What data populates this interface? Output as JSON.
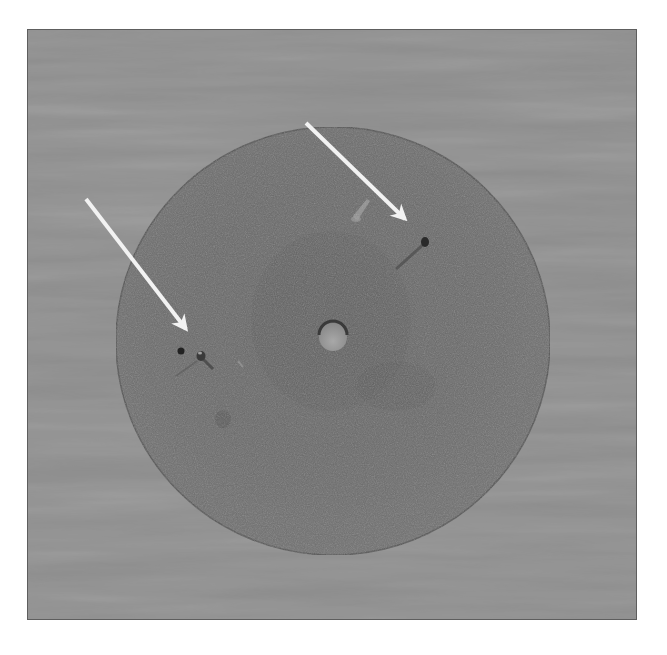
{
  "image": {
    "description": "Grayscale photograph of a flat circular disc with a small central hole resting on a fabric background; two white arrows point to surface defects",
    "frame": {
      "x": 27,
      "y": 29,
      "width": 610,
      "height": 591,
      "border_color": "#5e5e5e"
    },
    "colors": {
      "page_background": "#ffffff",
      "fabric_background": "#8f8f8f",
      "disc": "#6c6c6c",
      "disc_edge": "#555555",
      "arrows": "#f2f2f2",
      "defect": "#2a2a2a"
    },
    "disc": {
      "cx": 332,
      "cy": 340,
      "rx": 217,
      "ry": 214
    },
    "center_hole": {
      "cx": 332,
      "cy": 337,
      "r": 14
    },
    "arrows": [
      {
        "name": "arrow-upper-right",
        "from": [
          305,
          122
        ],
        "to": [
          406,
          220
        ]
      },
      {
        "name": "arrow-left",
        "from": [
          85,
          198
        ],
        "to": [
          187,
          330
        ]
      }
    ],
    "defects": [
      {
        "name": "defect-upper-right",
        "cx": 424,
        "cy": 241
      },
      {
        "name": "defect-left-a",
        "cx": 180,
        "cy": 350
      },
      {
        "name": "defect-left-b",
        "cx": 200,
        "cy": 355
      }
    ]
  }
}
